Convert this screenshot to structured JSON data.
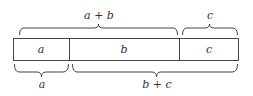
{
  "segments": [
    {
      "label": "a"
    },
    {
      "label": "b"
    },
    {
      "label": "c"
    }
  ],
  "top_braces": [
    {
      "label": "a + b"
    },
    {
      "label": "c"
    }
  ],
  "bottom_braces": [
    {
      "label": "a"
    },
    {
      "label": "b + c"
    }
  ],
  "colors": {
    "stroke": "#444444",
    "text": "#333333",
    "background": "#ffffff"
  }
}
